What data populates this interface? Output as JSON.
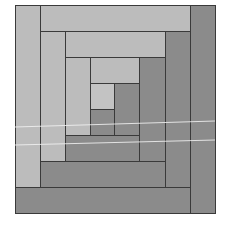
{
  "figure": {
    "colors": {
      "light": "#bcbcbc",
      "dark": "#8b8b8b",
      "center": "#c3c3c3",
      "outline": "#3a3a3a",
      "background": "#ffffff",
      "scan_line": "#f2f2f2"
    },
    "blocks": [
      {
        "id": "center",
        "x": 90,
        "y": 83,
        "w": 25,
        "h": 27,
        "tone": "center"
      },
      {
        "id": "r1-bottom",
        "x": 90,
        "y": 109,
        "w": 25,
        "h": 27,
        "tone": "dark"
      },
      {
        "id": "r1-right",
        "x": 114,
        "y": 83,
        "w": 26,
        "h": 53,
        "tone": "dark"
      },
      {
        "id": "r1-top",
        "x": 90,
        "y": 57,
        "w": 50,
        "h": 27,
        "tone": "light"
      },
      {
        "id": "r1-left",
        "x": 65,
        "y": 57,
        "w": 26,
        "h": 79,
        "tone": "light"
      },
      {
        "id": "r2-bottom",
        "x": 65,
        "y": 135,
        "w": 75,
        "h": 27,
        "tone": "dark"
      },
      {
        "id": "r2-right",
        "x": 139,
        "y": 57,
        "w": 27,
        "h": 105,
        "tone": "dark"
      },
      {
        "id": "r2-top",
        "x": 65,
        "y": 31,
        "w": 101,
        "h": 27,
        "tone": "light"
      },
      {
        "id": "r2-left",
        "x": 40,
        "y": 31,
        "w": 26,
        "h": 131,
        "tone": "light"
      },
      {
        "id": "r3-bottom",
        "x": 40,
        "y": 161,
        "w": 126,
        "h": 27,
        "tone": "dark"
      },
      {
        "id": "r3-right",
        "x": 165,
        "y": 31,
        "w": 26,
        "h": 157,
        "tone": "dark"
      },
      {
        "id": "r3-top",
        "x": 40,
        "y": 5,
        "w": 151,
        "h": 27,
        "tone": "light"
      },
      {
        "id": "r3-left",
        "x": 15,
        "y": 5,
        "w": 26,
        "h": 183,
        "tone": "light"
      },
      {
        "id": "r4-bottom",
        "x": 15,
        "y": 187,
        "w": 176,
        "h": 27,
        "tone": "dark"
      },
      {
        "id": "r4-right",
        "x": 190,
        "y": 5,
        "w": 26,
        "h": 209,
        "tone": "dark"
      }
    ],
    "scan_lines": [
      {
        "x1": 15,
        "y1": 127,
        "x2": 215,
        "y2": 121
      },
      {
        "x1": 15,
        "y1": 145,
        "x2": 215,
        "y2": 140
      }
    ]
  }
}
